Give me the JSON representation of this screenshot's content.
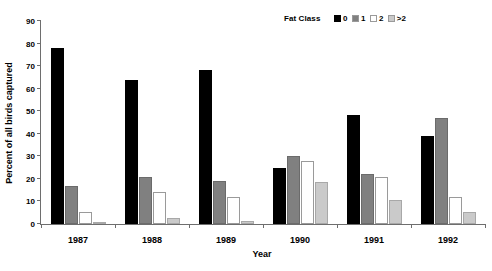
{
  "chart_data": {
    "type": "bar",
    "title": "",
    "xlabel": "Year",
    "ylabel": "Percent of all birds captured",
    "categories": [
      "1987",
      "1988",
      "1989",
      "1990",
      "1991",
      "1992"
    ],
    "ylim": [
      0,
      90
    ],
    "yticks": [
      0,
      10,
      20,
      30,
      40,
      50,
      60,
      70,
      80,
      90
    ],
    "grid": false,
    "legend_title": "Fat Class",
    "legend_position": "top-right",
    "series": [
      {
        "name": "0",
        "color": "#000000",
        "values": [
          78,
          64,
          68.5,
          25,
          48.5,
          39
        ]
      },
      {
        "name": "1",
        "color": "#808080",
        "values": [
          17,
          21,
          19,
          30,
          22,
          47
        ]
      },
      {
        "name": "2",
        "color": "#ffffff",
        "values": [
          5.5,
          14,
          12,
          28,
          21,
          12
        ]
      },
      {
        "name": ">2",
        "color": "#cacaca",
        "values": [
          0.5,
          2.8,
          1.3,
          18.5,
          10.5,
          5.5
        ]
      }
    ]
  }
}
